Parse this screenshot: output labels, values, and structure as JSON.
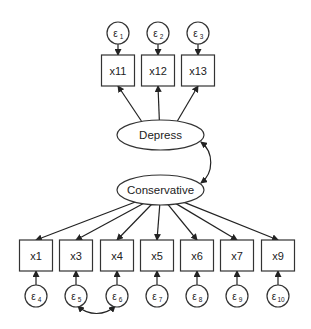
{
  "diagram": {
    "type": "structural-equation-model",
    "latent_variables": [
      {
        "id": "depress",
        "label": "Depress",
        "cx": 160.5,
        "cy": 135,
        "rx": 43.5,
        "ry": 15
      },
      {
        "id": "conservative",
        "label": "Conservative",
        "cx": 160.5,
        "cy": 190,
        "rx": 43.5,
        "ry": 15
      }
    ],
    "observed_top": [
      {
        "label": "x11",
        "cx": 118,
        "error": {
          "symbol": "ε",
          "sub": "1",
          "cy": 33
        }
      },
      {
        "label": "x12",
        "cx": 158,
        "error": {
          "symbol": "ε",
          "sub": "2",
          "cy": 33
        }
      },
      {
        "label": "x13",
        "cx": 198,
        "error": {
          "symbol": "ε",
          "sub": "3",
          "cy": 33
        }
      }
    ],
    "observed_bottom": [
      {
        "label": "x1",
        "cx": 36,
        "error": {
          "symbol": "ε",
          "sub": "4",
          "cy": 296
        }
      },
      {
        "label": "x3",
        "cx": 76,
        "error": {
          "symbol": "ε",
          "sub": "5",
          "cy": 296
        }
      },
      {
        "label": "x4",
        "cx": 117,
        "error": {
          "symbol": "ε",
          "sub": "6",
          "cy": 296
        }
      },
      {
        "label": "x5",
        "cx": 157,
        "error": {
          "symbol": "ε",
          "sub": "7",
          "cy": 296
        }
      },
      {
        "label": "x6",
        "cx": 197,
        "error": {
          "symbol": "ε",
          "sub": "8",
          "cy": 296
        }
      },
      {
        "label": "x7",
        "cx": 237,
        "error": {
          "symbol": "ε",
          "sub": "9",
          "cy": 296
        }
      },
      {
        "label": "x9",
        "cx": 278,
        "error": {
          "symbol": "ε",
          "sub": "10",
          "cy": 296
        }
      }
    ],
    "covariances": [
      {
        "from": "Depress",
        "to": "Conservative"
      },
      {
        "from": "ε5",
        "to": "ε6"
      }
    ],
    "paths": [
      {
        "from": "Depress",
        "to": [
          "x11",
          "x12",
          "x13"
        ]
      },
      {
        "from": "Conservative",
        "to": [
          "x1",
          "x3",
          "x4",
          "x5",
          "x6",
          "x7",
          "x9"
        ]
      }
    ]
  }
}
